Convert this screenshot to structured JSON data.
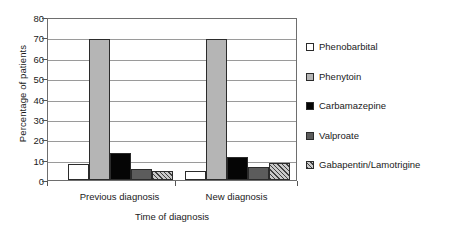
{
  "chart_data": {
    "type": "bar",
    "title": "",
    "subtitle": "",
    "xlabel": "Time of diagnosis",
    "ylabel": "Percentage of patients",
    "categories": [
      "Previous diagnosis",
      "New diagnosis"
    ],
    "series": [
      {
        "name": "Phenobarbital",
        "values": [
          8.0,
          4.5
        ],
        "fill": "open",
        "color": "#ffffff"
      },
      {
        "name": "Phenytoin",
        "values": [
          69.0,
          69.0
        ],
        "fill": "light",
        "color": "#b5b5b5"
      },
      {
        "name": "Carbamazepine",
        "values": [
          13.5,
          11.5
        ],
        "fill": "black",
        "color": "#050505"
      },
      {
        "name": "Valproate",
        "values": [
          5.5,
          6.5
        ],
        "fill": "dark",
        "color": "#5c5c5c"
      },
      {
        "name": "Gabapentin/Lamotrigine",
        "values": [
          4.5,
          8.5
        ],
        "fill": "hatch",
        "color": "#c9c9c9"
      }
    ],
    "ylim": [
      0,
      80
    ],
    "yticks": [
      0,
      10,
      20,
      30,
      40,
      50,
      60,
      70,
      80
    ],
    "ytick_labels": [
      "0",
      "10",
      "20",
      "30",
      "40",
      "50",
      "60",
      "70",
      "80"
    ],
    "grid": true,
    "grid_axis": "y",
    "legend_position": "right",
    "legend_entries": [
      "Phenobarbital",
      "Phenytoin",
      "Carbamazepine",
      "Valproate",
      "Gabapentin/Lamotrigine"
    ]
  }
}
